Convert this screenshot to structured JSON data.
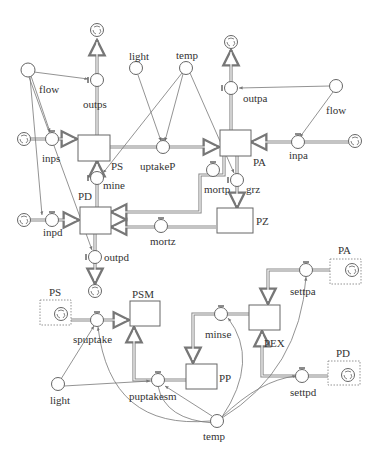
{
  "diagram": {
    "type": "stock-and-flow",
    "stocks": [
      {
        "id": "PS",
        "label": "PS"
      },
      {
        "id": "PA",
        "label": "PA"
      },
      {
        "id": "PD",
        "label": "PD"
      },
      {
        "id": "PZ",
        "label": "PZ"
      },
      {
        "id": "PSM",
        "label": "PSM"
      },
      {
        "id": "PP",
        "label": "PP"
      },
      {
        "id": "PEX",
        "label": "PEX"
      }
    ],
    "ghost_stocks": [
      {
        "id": "PS_ghost",
        "label": "PS"
      },
      {
        "id": "PA_ghost",
        "label": "PA"
      },
      {
        "id": "PD_ghost",
        "label": "PD"
      }
    ],
    "flows": [
      {
        "id": "outps",
        "label": "outps"
      },
      {
        "id": "inps",
        "label": "inps"
      },
      {
        "id": "uptakeP",
        "label": "uptakeP"
      },
      {
        "id": "outpa",
        "label": "outpa"
      },
      {
        "id": "inpa",
        "label": "inpa"
      },
      {
        "id": "mine",
        "label": "mine"
      },
      {
        "id": "inpd",
        "label": "inpd"
      },
      {
        "id": "mortp",
        "label": "mortp"
      },
      {
        "id": "grz",
        "label": "grz"
      },
      {
        "id": "mortz",
        "label": "mortz"
      },
      {
        "id": "outpd",
        "label": "outpd"
      },
      {
        "id": "spuptake",
        "label": "spuptake"
      },
      {
        "id": "puptakesm",
        "label": "puptakesm"
      },
      {
        "id": "minse",
        "label": "minse"
      },
      {
        "id": "settpa",
        "label": "settpa"
      },
      {
        "id": "settpd",
        "label": "settpd"
      }
    ],
    "converters": [
      {
        "id": "flow_left",
        "label": "flow"
      },
      {
        "id": "light_top",
        "label": "light"
      },
      {
        "id": "temp_top",
        "label": "temp"
      },
      {
        "id": "flow_right",
        "label": "flow"
      },
      {
        "id": "light_bottom",
        "label": "light"
      },
      {
        "id": "temp_bottom",
        "label": "temp"
      }
    ]
  }
}
